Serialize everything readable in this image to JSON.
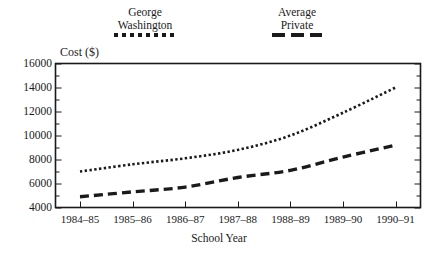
{
  "legend": {
    "entries": [
      {
        "name": "george-washington",
        "line1": "George",
        "line2": "Washington",
        "style": "dotted"
      },
      {
        "name": "average-private",
        "line1": "Average",
        "line2": "Private",
        "style": "dashed"
      }
    ]
  },
  "axes": {
    "ylabel": "Cost ($)",
    "xlabel": "School Year",
    "ytick_labels": [
      "16000",
      "14000",
      "12000",
      "10000",
      "8000",
      "6000",
      "4000"
    ]
  },
  "chart_data": {
    "type": "line",
    "title": "",
    "subtitle": "",
    "xlabel": "School Year",
    "ylabel": "Cost ($)",
    "categories": [
      "1984–85",
      "1985–86",
      "1986–87",
      "1987–88",
      "1988–89",
      "1989–90",
      "1990–91"
    ],
    "ylim": [
      4000,
      16000
    ],
    "ytick_values": [
      4000,
      6000,
      8000,
      10000,
      12000,
      14000,
      16000
    ],
    "ytick_step": 2000,
    "yminor_step": 1000,
    "grid": false,
    "legend_position": "top",
    "series": [
      {
        "name": "George Washington",
        "linestyle": "dotted",
        "color": "#1a1a1a",
        "values": [
          7000,
          7600,
          8100,
          8800,
          10000,
          11900,
          14000
        ]
      },
      {
        "name": "Average Private",
        "linestyle": "dashed",
        "color": "#1a1a1a",
        "values": [
          4900,
          5300,
          5700,
          6500,
          7100,
          8200,
          9200
        ]
      }
    ]
  }
}
